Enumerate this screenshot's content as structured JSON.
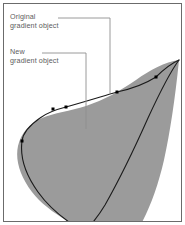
{
  "figure": {
    "background_color": "#ffffff",
    "frame": {
      "border_color": "#6b6b6b",
      "border_width_px": 1,
      "inset_px": 3
    }
  },
  "callouts": [
    {
      "id": "original",
      "name": "callout-original-gradient-object",
      "line1": "Original",
      "line2": "gradient object",
      "text_color": "#5d5d5d",
      "leader": {
        "color": "#8e8e8e",
        "start": [
          58,
          18
        ],
        "elbow": [
          110,
          18
        ],
        "end": [
          110,
          93
        ]
      }
    },
    {
      "id": "new",
      "name": "callout-new-gradient-object",
      "line1": "New",
      "line2": "gradient object",
      "text_color": "#5d5d5d",
      "leader": {
        "color": "#8e8e8e",
        "start": [
          42,
          53
        ],
        "elbow": [
          86,
          53
        ],
        "end": [
          86,
          129
        ]
      }
    }
  ],
  "artwork": {
    "original_object": {
      "name": "original-gradient-object-shape",
      "fill_color": "#9b9b9b",
      "description": "Gray teardrop / leaf shape with pointed tip at upper right",
      "tip_point": [
        179,
        60
      ],
      "left_extent": [
        17,
        148
      ],
      "bottom_clip_y": 211
    },
    "new_object": {
      "name": "new-gradient-object-path",
      "stroke_color": "#1b1b1b",
      "stroke_width_px": 1,
      "description": "Black outline path offset inside the gray shape"
    },
    "anchor_points": {
      "name": "path-anchor-points",
      "fill_color": "#000000",
      "size_px": 3,
      "points": [
        [
          22,
          141
        ],
        [
          53,
          109
        ],
        [
          66,
          107
        ],
        [
          117,
          92
        ],
        [
          156,
          77
        ]
      ]
    }
  }
}
